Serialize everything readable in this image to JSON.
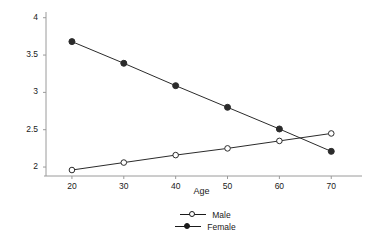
{
  "chart_data": {
    "type": "line",
    "title": "",
    "xlabel": "Age",
    "ylabel": "Number of doctor visits per year",
    "x": [
      20,
      30,
      40,
      50,
      60,
      70
    ],
    "xtick_labels": [
      "20",
      "30",
      "40",
      "50",
      "60",
      "70"
    ],
    "ytick_labels": [
      "2",
      "2.5",
      "3",
      "3.5",
      "4"
    ],
    "ytick_values": [
      2,
      2.5,
      3,
      3.5,
      4
    ],
    "xlim": [
      15,
      74
    ],
    "ylim": [
      1.88,
      4.05
    ],
    "grid": false,
    "legend_position": "bottom-center",
    "series": [
      {
        "name": "Male",
        "marker": "open-circle",
        "color": "#1a1a1a",
        "values": [
          1.96,
          2.06,
          2.16,
          2.25,
          2.35,
          2.45
        ]
      },
      {
        "name": "Female",
        "marker": "filled-circle",
        "color": "#1a1a1a",
        "values": [
          3.68,
          3.39,
          3.09,
          2.8,
          2.51,
          2.21
        ]
      }
    ]
  },
  "axes": {
    "xlabel": "Age",
    "ylabel": "Number of doctor visits per year"
  },
  "legend": {
    "items": [
      {
        "label": "Male"
      },
      {
        "label": "Female"
      }
    ]
  }
}
